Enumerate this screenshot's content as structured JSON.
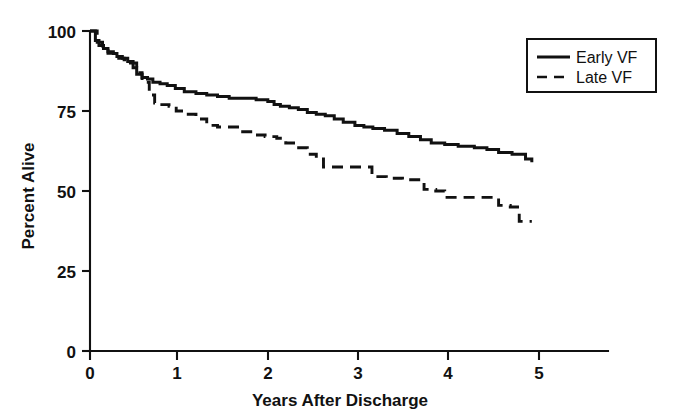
{
  "chart_data": {
    "type": "line",
    "title": "",
    "subtitle": "",
    "xlabel": "Years After Discharge",
    "ylabel": "Percent Alive",
    "xlim": [
      0,
      5.7
    ],
    "ylim": [
      0,
      100
    ],
    "xticks": [
      "0",
      "1",
      "2",
      "3",
      "4",
      "5"
    ],
    "xtick_values": [
      0,
      1,
      2,
      3,
      4,
      5
    ],
    "yticks": [
      "0",
      "25",
      "50",
      "75",
      "100"
    ],
    "ytick_values": [
      0,
      25,
      50,
      75,
      100
    ],
    "grid": false,
    "legend_position": "top-right",
    "step_style": "kaplan-meier",
    "series": [
      {
        "name": "Early VF",
        "style": "solid",
        "color": "#111111",
        "x": [
          0.0,
          0.06,
          0.1,
          0.15,
          0.2,
          0.26,
          0.3,
          0.36,
          0.42,
          0.48,
          0.52,
          0.58,
          0.64,
          0.7,
          0.78,
          0.86,
          0.95,
          1.05,
          1.18,
          1.3,
          1.42,
          1.55,
          1.7,
          1.85,
          1.98,
          2.05,
          2.12,
          2.22,
          2.32,
          2.42,
          2.52,
          2.62,
          2.72,
          2.82,
          2.95,
          3.05,
          3.15,
          3.28,
          3.42,
          3.55,
          3.68,
          3.8,
          3.95,
          4.1,
          4.28,
          4.42,
          4.55,
          4.7,
          4.85,
          4.92
        ],
        "y": [
          100.0,
          97.0,
          95.5,
          94.5,
          93.5,
          93.0,
          92.0,
          91.5,
          90.5,
          88.5,
          86.5,
          85.5,
          85.0,
          84.0,
          83.5,
          83.0,
          82.0,
          81.0,
          80.5,
          80.0,
          79.5,
          79.0,
          79.0,
          78.5,
          78.0,
          77.0,
          76.5,
          76.0,
          75.5,
          74.5,
          74.0,
          73.5,
          72.5,
          71.5,
          70.5,
          70.0,
          69.5,
          69.0,
          68.0,
          67.0,
          66.0,
          65.0,
          64.5,
          64.0,
          63.5,
          63.0,
          62.0,
          61.5,
          60.0,
          59.0
        ]
      },
      {
        "name": "Late VF",
        "style": "dashed",
        "color": "#111111",
        "x": [
          0.0,
          0.08,
          0.14,
          0.2,
          0.26,
          0.32,
          0.38,
          0.45,
          0.52,
          0.58,
          0.66,
          0.72,
          0.8,
          0.88,
          0.96,
          1.06,
          1.18,
          1.3,
          1.42,
          1.58,
          1.7,
          1.82,
          1.95,
          2.08,
          2.18,
          2.3,
          2.42,
          2.52,
          2.6,
          2.8,
          3.05,
          3.14,
          3.3,
          3.48,
          3.65,
          3.72,
          3.85,
          3.95,
          4.2,
          4.45,
          4.55,
          4.68,
          4.78,
          4.92
        ],
        "y": [
          100.0,
          96.5,
          94.5,
          93.0,
          92.0,
          91.5,
          91.0,
          90.0,
          87.0,
          84.0,
          80.0,
          77.5,
          77.0,
          76.5,
          75.0,
          74.0,
          72.5,
          70.5,
          70.0,
          70.0,
          68.5,
          67.5,
          67.0,
          66.5,
          65.0,
          63.5,
          61.5,
          60.0,
          57.5,
          57.5,
          57.5,
          54.5,
          54.0,
          53.5,
          53.5,
          50.5,
          50.0,
          48.0,
          48.0,
          48.0,
          45.5,
          45.0,
          40.5,
          40.5
        ]
      }
    ]
  },
  "legend": {
    "entries": [
      {
        "label": "Early VF",
        "style": "solid"
      },
      {
        "label": "Late VF",
        "style": "dashed"
      }
    ]
  },
  "axes": {
    "x_title": "Years After Discharge",
    "y_title": "Percent Alive"
  }
}
